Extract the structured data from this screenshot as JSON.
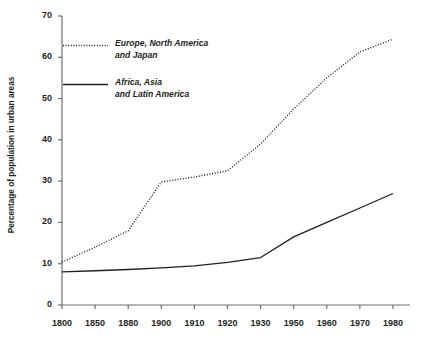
{
  "chart_data": {
    "type": "line",
    "title": "",
    "xlabel": "",
    "ylabel": "Percentage of population in urban areas",
    "categories": [
      "1800",
      "1850",
      "1880",
      "1900",
      "1910",
      "1920",
      "1930",
      "1950",
      "1960",
      "1970",
      "1980"
    ],
    "ylim": [
      0,
      70
    ],
    "yticks": [
      0,
      10,
      20,
      30,
      40,
      50,
      60,
      70
    ],
    "ytick_labels": [
      "0",
      "10",
      "20",
      "30",
      "40",
      "50",
      "60",
      "70"
    ],
    "grid": false,
    "legend_position": "upper-left-inside",
    "series": [
      {
        "name": "Europe, North America and Japan",
        "legend_line1": "Europe, North America",
        "legend_line2": "and Japan",
        "style": "dotted",
        "color": "#231f20",
        "values": [
          10.4,
          14.0,
          18.0,
          29.8,
          31.0,
          32.5,
          39.0,
          47.5,
          55.0,
          61.3,
          64.4
        ]
      },
      {
        "name": "Africa, Asia and Latin America",
        "legend_line1": "Africa, Asia",
        "legend_line2": "and Latin America",
        "style": "solid",
        "color": "#231f20",
        "values": [
          8.0,
          8.3,
          8.6,
          9.0,
          9.5,
          10.3,
          11.5,
          16.5,
          20.0,
          23.5,
          27.0
        ]
      }
    ]
  },
  "axis": {
    "line_color": "#6d6e71"
  }
}
